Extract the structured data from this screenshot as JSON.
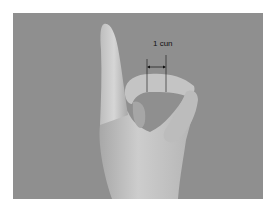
{
  "figure": {
    "annotation": {
      "label": "1 cun",
      "type": "dimension-arrow"
    },
    "colors": {
      "background": "#ffffff",
      "photo_background": "#8f8f8f",
      "skin_light": "#c9c9c9",
      "skin_mid": "#b2b2b2",
      "skin_shadow": "#8a8a8a",
      "annotation_line": "#111111"
    }
  }
}
